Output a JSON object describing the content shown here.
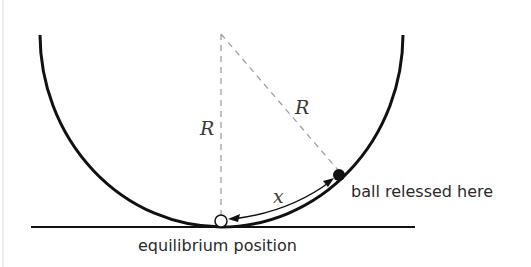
{
  "diagram": {
    "labels": {
      "radius_vertical": "R",
      "radius_diagonal": "R",
      "arc_length": "x",
      "ball_label": "ball relessed here",
      "equilibrium_label": "equilibrium position"
    },
    "colors": {
      "bowl": "#111111",
      "dashed": "#a0a0a0",
      "text": "#2a2a2a",
      "ball_fill": "#111111",
      "equilibrium_fill": "#ffffff"
    }
  }
}
